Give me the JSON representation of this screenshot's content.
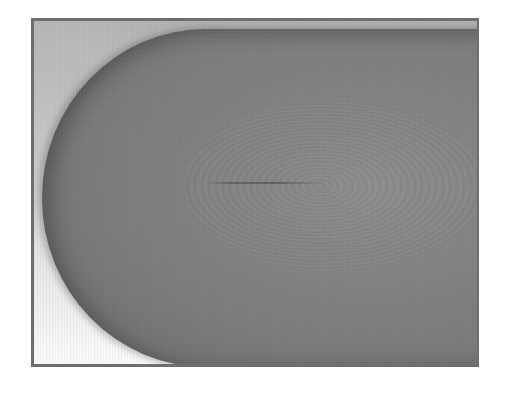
{
  "image": {
    "description": "Grayscale photograph of a rounded object tip inside a dark rectangular frame",
    "subject": "rounded-tip-object",
    "colors": {
      "frame_border": "#6e6e6e",
      "object_fill": "#7c7c7c",
      "background_top": "#b2b2b2",
      "background_bottom": "#ffffff"
    }
  }
}
